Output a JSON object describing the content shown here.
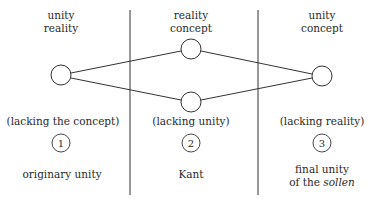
{
  "columns": [
    {
      "id": 1,
      "top_label": [
        "unity",
        "reality"
      ],
      "lacking_label": "(lacking the concept)",
      "number": "1",
      "bottom_label": [
        "originary unity"
      ]
    },
    {
      "id": 2,
      "top_label": [
        "reality",
        "concept"
      ],
      "lacking_label": "(lacking unity)",
      "number": "2",
      "bottom_label": [
        "Kant"
      ]
    },
    {
      "id": 3,
      "top_label": [
        "unity",
        "concept"
      ],
      "lacking_label": "(lacking reality)",
      "number": "3",
      "bottom_label_line1": "final unity",
      "bottom_label_line2_prefix": "of the ",
      "bottom_label_line2_italic": "sollen"
    }
  ],
  "nodes": [
    {
      "name": "left-node",
      "cx": 61,
      "cy": 75
    },
    {
      "name": "middle-top-node",
      "cx": 191,
      "cy": 49
    },
    {
      "name": "middle-bottom-node",
      "cx": 191,
      "cy": 102
    },
    {
      "name": "right-node",
      "cx": 322,
      "cy": 76
    }
  ],
  "edges": [
    [
      "left-node",
      "middle-top-node"
    ],
    [
      "left-node",
      "middle-bottom-node"
    ],
    [
      "middle-top-node",
      "right-node"
    ],
    [
      "middle-bottom-node",
      "right-node"
    ]
  ],
  "colors": {
    "stroke": "#333333",
    "text": "#2a2a2a"
  }
}
